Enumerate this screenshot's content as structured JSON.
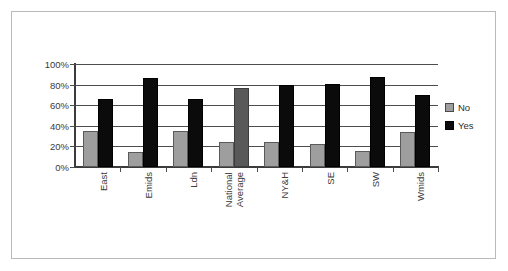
{
  "chart_data": {
    "type": "bar",
    "title": "",
    "xlabel": "",
    "ylabel": "",
    "ylim": [
      0,
      100
    ],
    "ytick_labels": [
      "100%",
      "80%",
      "60%",
      "40%",
      "20%",
      "0%"
    ],
    "ytick_values": [
      100,
      80,
      60,
      40,
      20,
      0
    ],
    "grid": true,
    "legend_position": "right",
    "categories": [
      "East",
      "Emids",
      "Ldn",
      "National Average",
      "NY&H",
      "SE",
      "SW",
      "Wmids"
    ],
    "series": [
      {
        "name": "No",
        "color": "#9e9e9e",
        "values": [
          35,
          15,
          35,
          24,
          24,
          22,
          16,
          34
        ]
      },
      {
        "name": "Yes",
        "color": "#0b0b0b",
        "values": [
          66,
          86,
          66,
          77,
          80,
          81,
          87,
          70
        ]
      }
    ]
  },
  "axis": {
    "ticks": [
      {
        "label": "100%",
        "value": 100
      },
      {
        "label": "80%",
        "value": 80
      },
      {
        "label": "60%",
        "value": 60
      },
      {
        "label": "40%",
        "value": 40
      },
      {
        "label": "20%",
        "value": 20
      },
      {
        "label": "0%",
        "value": 0
      }
    ]
  },
  "categories": [
    {
      "label": "East",
      "lines": [
        "East"
      ]
    },
    {
      "label": "Emids",
      "lines": [
        "Emids"
      ]
    },
    {
      "label": "Ldn",
      "lines": [
        "Ldn"
      ]
    },
    {
      "label": "National Average",
      "lines": [
        "National",
        "Average"
      ]
    },
    {
      "label": "NY&H",
      "lines": [
        "NY&H"
      ]
    },
    {
      "label": "SE",
      "lines": [
        "SE"
      ]
    },
    {
      "label": "SW",
      "lines": [
        "SW"
      ]
    },
    {
      "label": "Wmids",
      "lines": [
        "Wmids"
      ]
    }
  ],
  "legend": {
    "items": [
      {
        "label": "No",
        "color": "#9e9e9e"
      },
      {
        "label": "Yes",
        "color": "#0b0b0b"
      }
    ]
  }
}
